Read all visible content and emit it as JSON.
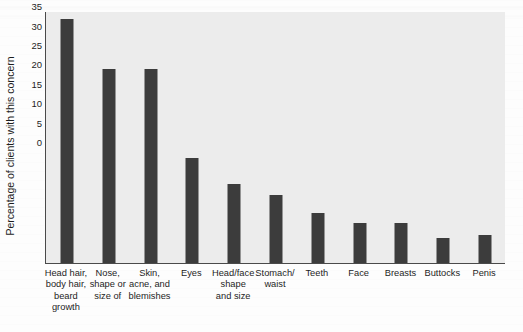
{
  "chart_data": {
    "type": "bar",
    "title": "",
    "subtitle": "",
    "xlabel": "",
    "ylabel": "Percentage of clients with this concern",
    "ylim": [
      0,
      65
    ],
    "ytick_step": 5,
    "yticks": [
      0,
      5,
      10,
      15,
      20,
      25,
      30,
      35,
      40,
      45,
      50,
      55,
      60,
      65
    ],
    "ytick_labels": [
      "0",
      "5",
      "10",
      "15",
      "20",
      "25",
      "30",
      "35",
      "40",
      "45",
      "50",
      "55",
      "60",
      "65"
    ],
    "grid": false,
    "legend": null,
    "legend_position": "none",
    "bar_color": "#3c3c3c",
    "plot_background": "#ececec",
    "axis_color": "#4a4a4a",
    "categories": [
      "Head hair, body hair, beard growth",
      "Nose, shape or size of",
      "Skin, acne, and blemishes",
      "Eyes",
      "Head/face shape and size",
      "Stomach/ waist",
      "Teeth",
      "Face",
      "Breasts",
      "Buttocks",
      "Penis"
    ],
    "category_label_lines": [
      [
        "Head hair,",
        "body hair,",
        "beard",
        "growth"
      ],
      [
        "Nose,",
        "shape or",
        "size of"
      ],
      [
        "Skin,",
        "acne, and",
        "blemishes"
      ],
      [
        "Eyes"
      ],
      [
        "Head/face",
        "shape",
        "and size"
      ],
      [
        "Stomach/",
        "waist"
      ],
      [
        "Teeth"
      ],
      [
        "Face"
      ],
      [
        "Breasts"
      ],
      [
        "Buttocks"
      ],
      [
        "Penis"
      ]
    ],
    "values": [
      63,
      50,
      50,
      27,
      20.5,
      17.5,
      13,
      10.3,
      10.3,
      6.5,
      7.3
    ]
  }
}
